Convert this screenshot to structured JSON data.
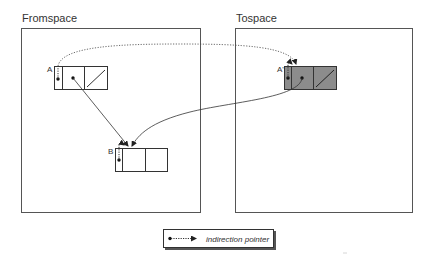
{
  "fromspace": {
    "title": "Fromspace",
    "objects": [
      {
        "label": "A"
      },
      {
        "label": "B"
      }
    ]
  },
  "tospace": {
    "title": "Tospace",
    "objects": [
      {
        "label": "A'",
        "fill": "#8c8c8c"
      }
    ]
  },
  "legend": {
    "text": "indirection pointer",
    "symbol": "dot-dashed-arrow"
  },
  "colors": {
    "stroke": "#333333",
    "copied_fill": "#8c8c8c"
  }
}
